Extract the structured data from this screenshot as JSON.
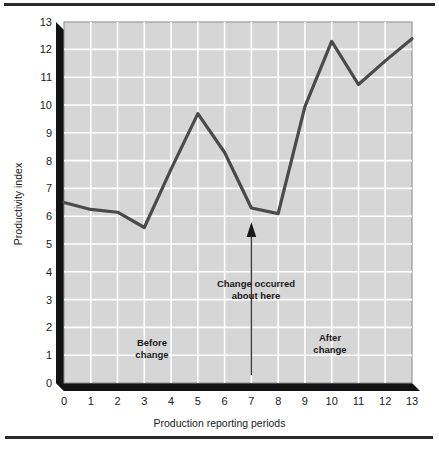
{
  "figure": {
    "name": "productivity-index-line-chart"
  },
  "chart_data": {
    "type": "line",
    "title": "",
    "xlabel": "Production reporting periods",
    "ylabel": "Productivity index",
    "x": [
      0,
      1,
      2,
      3,
      4,
      5,
      6,
      7,
      8,
      9,
      10,
      11,
      12,
      13
    ],
    "values": [
      6.5,
      6.25,
      6.15,
      5.6,
      7.7,
      9.7,
      8.3,
      6.3,
      6.1,
      9.95,
      12.3,
      10.75,
      11.6,
      12.4
    ],
    "series": [
      {
        "name": "Productivity index",
        "values": [
          6.5,
          6.25,
          6.15,
          5.6,
          7.7,
          9.7,
          8.3,
          6.3,
          6.1,
          9.95,
          12.3,
          10.75,
          11.6,
          12.4
        ]
      }
    ],
    "xlim": [
      0,
      13
    ],
    "ylim": [
      0,
      13
    ],
    "xticks": [
      "0",
      "1",
      "2",
      "3",
      "4",
      "5",
      "6",
      "7",
      "8",
      "9",
      "10",
      "11",
      "12",
      "13"
    ],
    "yticks": [
      "0",
      "1",
      "2",
      "3",
      "4",
      "5",
      "6",
      "7",
      "8",
      "9",
      "10",
      "11",
      "12",
      "13"
    ],
    "grid": true,
    "legend": "none",
    "line_color": "#4a4a4a",
    "plot_background": "#d6d6d6",
    "grid_color": "#ffffff",
    "annotations": [
      {
        "name": "change-marker",
        "line1": "Change occurred",
        "line2": "about here",
        "x": 7,
        "arrow": "up"
      },
      {
        "name": "before-change",
        "line1": "Before",
        "line2": "change"
      },
      {
        "name": "after-change",
        "line1": "After",
        "line2": "change"
      }
    ]
  }
}
